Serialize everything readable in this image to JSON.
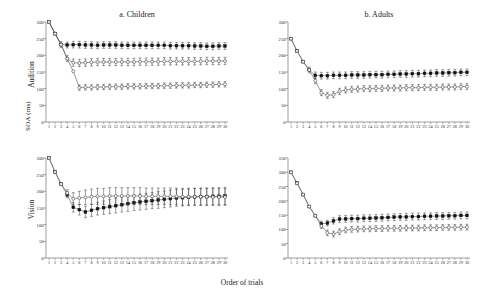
{
  "figure": {
    "ylabel": "SOA (ms)",
    "xlabel": "Order of trials",
    "row_labels": [
      "Audition",
      "Vision"
    ],
    "column_titles": [
      "a. Children",
      "b. Adults"
    ],
    "colors": {
      "filled_marker": "#111111",
      "open_marker": "#ffffff",
      "open_marker_edge": "#3a3a3a",
      "line": "#555555",
      "axis": "#777777"
    }
  },
  "chart_data": [
    {
      "type": "line",
      "panel": "a. Children",
      "row": "Audition",
      "title": "a. Children",
      "xlabel": "Order of trials",
      "ylabel": "SOA (ms)",
      "xlim": [
        1,
        30
      ],
      "ylim": [
        0,
        300
      ],
      "yticks": [
        0,
        50,
        100,
        150,
        200,
        250,
        300
      ],
      "xticks": [
        1,
        2,
        3,
        4,
        5,
        6,
        7,
        8,
        9,
        10,
        11,
        12,
        13,
        14,
        15,
        16,
        17,
        18,
        19,
        20,
        21,
        22,
        23,
        24,
        25,
        26,
        27,
        28,
        29,
        30
      ],
      "grid": false,
      "legend": "none",
      "x": [
        1,
        2,
        3,
        4,
        5,
        6,
        7,
        8,
        9,
        10,
        11,
        12,
        13,
        14,
        15,
        16,
        17,
        18,
        19,
        20,
        21,
        22,
        23,
        24,
        25,
        26,
        27,
        28,
        29,
        30
      ],
      "series": [
        {
          "name": "series-1-filled",
          "marker": "filled-square",
          "values": [
            300,
            265,
            232,
            231,
            232,
            232,
            231,
            231,
            230,
            231,
            231,
            231,
            230,
            230,
            230,
            230,
            230,
            230,
            230,
            230,
            229,
            229,
            229,
            229,
            228,
            228,
            227,
            227,
            228,
            228
          ],
          "errors": [
            0,
            0,
            9,
            9,
            10,
            10,
            10,
            10,
            10,
            10,
            10,
            10,
            10,
            10,
            10,
            10,
            10,
            10,
            10,
            10,
            10,
            10,
            10,
            10,
            10,
            10,
            10,
            10,
            10,
            10
          ]
        },
        {
          "name": "series-2-open-mid",
          "marker": "open-circle",
          "values": [
            300,
            265,
            232,
            190,
            178,
            177,
            178,
            179,
            180,
            180,
            180,
            180,
            180,
            180,
            180,
            181,
            181,
            181,
            181,
            182,
            182,
            182,
            182,
            182,
            182,
            182,
            183,
            183,
            183,
            183
          ],
          "errors": [
            0,
            0,
            0,
            9,
            11,
            11,
            11,
            11,
            11,
            11,
            11,
            11,
            11,
            11,
            11,
            11,
            11,
            11,
            11,
            11,
            11,
            11,
            11,
            11,
            11,
            11,
            11,
            11,
            11,
            11
          ]
        },
        {
          "name": "series-3-open-low",
          "marker": "open-circle",
          "values": [
            300,
            265,
            232,
            190,
            152,
            103,
            104,
            104,
            105,
            105,
            106,
            106,
            106,
            107,
            107,
            107,
            108,
            108,
            108,
            109,
            109,
            110,
            110,
            110,
            111,
            111,
            112,
            112,
            113,
            113
          ],
          "errors": [
            0,
            0,
            0,
            0,
            0,
            8,
            8,
            8,
            8,
            8,
            8,
            8,
            8,
            8,
            8,
            8,
            8,
            8,
            8,
            8,
            8,
            8,
            8,
            8,
            8,
            8,
            8,
            8,
            8,
            8
          ]
        }
      ]
    },
    {
      "type": "line",
      "panel": "b. Adults",
      "row": "Audition",
      "title": "b. Adults",
      "xlabel": "Order of trials",
      "ylabel": "SOA (ms)",
      "xlim": [
        1,
        30
      ],
      "ylim": [
        0,
        300
      ],
      "yticks": [
        0,
        50,
        100,
        150,
        200,
        250,
        300
      ],
      "xticks": [
        1,
        2,
        3,
        4,
        5,
        6,
        7,
        8,
        9,
        10,
        11,
        12,
        13,
        14,
        15,
        16,
        17,
        18,
        19,
        20,
        21,
        22,
        23,
        24,
        25,
        26,
        27,
        28,
        29,
        30
      ],
      "grid": false,
      "legend": "none",
      "x": [
        1,
        2,
        3,
        4,
        5,
        6,
        7,
        8,
        9,
        10,
        11,
        12,
        13,
        14,
        15,
        16,
        17,
        18,
        19,
        20,
        21,
        22,
        23,
        24,
        25,
        26,
        27,
        28,
        29,
        30
      ],
      "series": [
        {
          "name": "series-1-filled",
          "marker": "filled-square",
          "values": [
            250,
            213,
            181,
            156,
            140,
            139,
            139,
            140,
            140,
            140,
            141,
            141,
            141,
            142,
            142,
            142,
            143,
            143,
            144,
            144,
            145,
            145,
            146,
            146,
            147,
            147,
            148,
            148,
            149,
            149
          ],
          "errors": [
            0,
            0,
            0,
            9,
            10,
            10,
            10,
            10,
            10,
            10,
            10,
            10,
            10,
            10,
            10,
            10,
            10,
            10,
            10,
            10,
            10,
            10,
            10,
            10,
            10,
            10,
            10,
            10,
            10,
            10
          ]
        },
        {
          "name": "series-2-open",
          "marker": "open-circle",
          "values": [
            250,
            213,
            181,
            156,
            124,
            88,
            80,
            82,
            92,
            96,
            98,
            99,
            100,
            100,
            101,
            101,
            102,
            102,
            102,
            103,
            103,
            103,
            104,
            104,
            104,
            105,
            105,
            105,
            106,
            106
          ],
          "errors": [
            0,
            0,
            0,
            0,
            9,
            9,
            9,
            9,
            9,
            9,
            9,
            9,
            9,
            9,
            9,
            9,
            9,
            9,
            9,
            9,
            9,
            9,
            9,
            9,
            9,
            9,
            9,
            9,
            9,
            9
          ]
        }
      ]
    },
    {
      "type": "line",
      "panel": "a. Children",
      "row": "Vision",
      "title": "",
      "xlabel": "Order of trials",
      "ylabel": "SOA (ms)",
      "xlim": [
        1,
        30
      ],
      "ylim": [
        0,
        300
      ],
      "yticks": [
        0,
        50,
        100,
        150,
        200,
        250,
        300
      ],
      "xticks": [
        1,
        2,
        3,
        4,
        5,
        6,
        7,
        8,
        9,
        10,
        11,
        12,
        13,
        14,
        15,
        16,
        17,
        18,
        19,
        20,
        21,
        22,
        23,
        24,
        25,
        26,
        27,
        28,
        29,
        30
      ],
      "grid": false,
      "legend": "none",
      "x": [
        1,
        2,
        3,
        4,
        5,
        6,
        7,
        8,
        9,
        10,
        11,
        12,
        13,
        14,
        15,
        16,
        17,
        18,
        19,
        20,
        21,
        22,
        23,
        24,
        25,
        26,
        27,
        28,
        29,
        30
      ],
      "series": [
        {
          "name": "series-1-filled",
          "marker": "filled-square",
          "values": [
            300,
            258,
            222,
            190,
            152,
            145,
            138,
            143,
            148,
            151,
            154,
            157,
            160,
            163,
            166,
            168,
            170,
            172,
            174,
            176,
            178,
            180,
            181,
            182,
            183,
            184,
            184,
            185,
            185,
            186
          ],
          "errors": [
            0,
            0,
            0,
            9,
            14,
            16,
            17,
            18,
            19,
            20,
            21,
            22,
            22,
            23,
            23,
            24,
            24,
            24,
            25,
            25,
            25,
            25,
            25,
            25,
            26,
            26,
            26,
            26,
            26,
            26
          ]
        },
        {
          "name": "series-2-open",
          "marker": "open-circle",
          "values": [
            300,
            258,
            222,
            195,
            178,
            180,
            182,
            184,
            185,
            185,
            186,
            186,
            186,
            186,
            186,
            186,
            185,
            185,
            185,
            185,
            185,
            185,
            184,
            184,
            184,
            184,
            184,
            183,
            183,
            183
          ],
          "errors": [
            0,
            0,
            0,
            10,
            18,
            20,
            22,
            23,
            24,
            24,
            25,
            25,
            25,
            25,
            25,
            25,
            25,
            25,
            25,
            25,
            25,
            25,
            25,
            25,
            25,
            25,
            25,
            25,
            25,
            25
          ]
        }
      ]
    },
    {
      "type": "line",
      "panel": "b. Adults",
      "row": "Vision",
      "title": "",
      "xlabel": "Order of trials",
      "ylabel": "SOA (ms)",
      "xlim": [
        1,
        350
      ],
      "ylim": [
        0,
        350
      ],
      "yticks": [
        0,
        50,
        100,
        150,
        200,
        250,
        300,
        350
      ],
      "xticks": [
        1,
        2,
        3,
        4,
        5,
        6,
        7,
        8,
        9,
        10,
        11,
        12,
        13,
        14,
        15,
        16,
        17,
        18,
        19,
        20,
        21,
        22,
        23,
        24,
        25,
        26,
        27,
        28,
        29,
        30
      ],
      "grid": false,
      "legend": "none",
      "x": [
        1,
        2,
        3,
        4,
        5,
        6,
        7,
        8,
        9,
        10,
        11,
        12,
        13,
        14,
        15,
        16,
        17,
        18,
        19,
        20,
        21,
        22,
        23,
        24,
        25,
        26,
        27,
        28,
        29,
        30
      ],
      "series": [
        {
          "name": "series-1-filled",
          "marker": "filled-square",
          "values": [
            300,
            262,
            222,
            180,
            148,
            120,
            122,
            130,
            136,
            137,
            138,
            138,
            139,
            139,
            140,
            141,
            142,
            143,
            144,
            144,
            145,
            145,
            146,
            146,
            147,
            147,
            148,
            148,
            149,
            149
          ],
          "errors": [
            0,
            0,
            0,
            0,
            0,
            9,
            10,
            11,
            12,
            12,
            12,
            12,
            12,
            12,
            12,
            12,
            12,
            12,
            12,
            12,
            12,
            12,
            12,
            12,
            12,
            12,
            12,
            12,
            12,
            12
          ]
        },
        {
          "name": "series-2-open",
          "marker": "open-circle",
          "values": [
            300,
            262,
            222,
            180,
            148,
            112,
            88,
            84,
            92,
            98,
            100,
            101,
            102,
            102,
            103,
            103,
            104,
            104,
            104,
            105,
            105,
            105,
            106,
            106,
            106,
            107,
            107,
            107,
            108,
            108
          ],
          "errors": [
            0,
            0,
            0,
            0,
            0,
            9,
            10,
            10,
            10,
            10,
            10,
            10,
            10,
            10,
            10,
            10,
            10,
            10,
            10,
            10,
            10,
            10,
            10,
            10,
            10,
            10,
            10,
            10,
            10,
            10
          ]
        }
      ]
    }
  ]
}
